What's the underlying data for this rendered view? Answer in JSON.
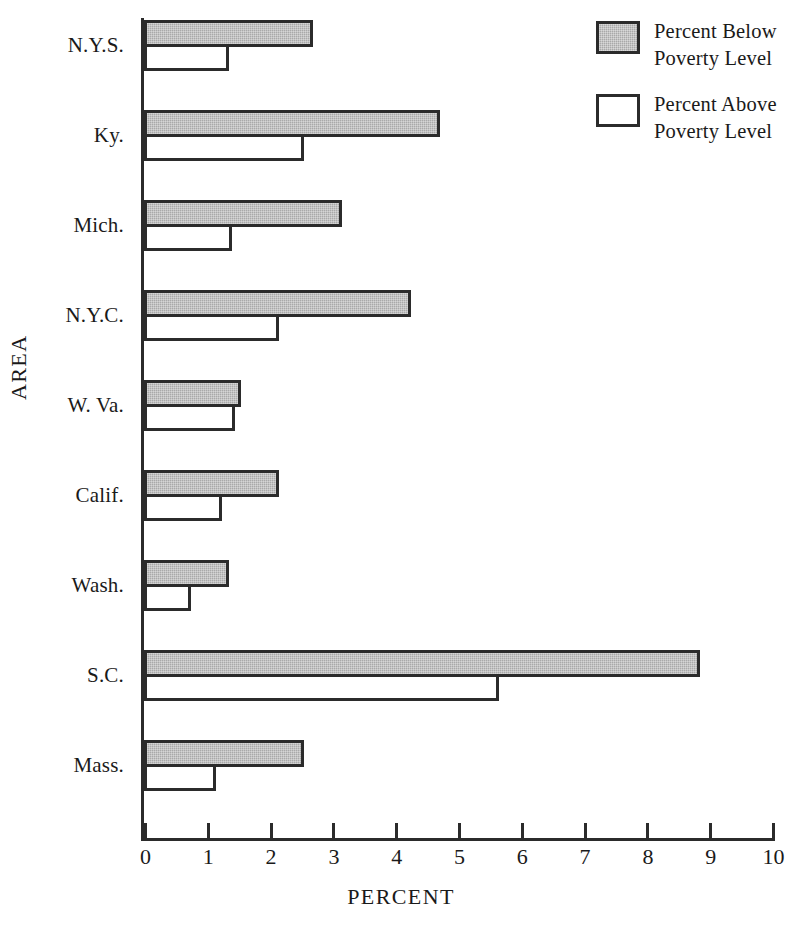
{
  "chart_data": {
    "type": "bar",
    "orientation": "horizontal",
    "title": "",
    "xlabel": "PERCENT",
    "ylabel": "AREA",
    "xlim": [
      0,
      10
    ],
    "xticks": [
      "0",
      "1",
      "2",
      "3",
      "4",
      "5",
      "6",
      "7",
      "8",
      "9",
      "10"
    ],
    "grid": false,
    "legend_position": "top-right",
    "categories": [
      "N.Y.S.",
      "Ky.",
      "Mich.",
      "N.Y.C.",
      "W. Va.",
      "Calif.",
      "Wash.",
      "S.C.",
      "Mass."
    ],
    "series": [
      {
        "name": "Percent Below Poverty Level",
        "color": "#a9a9a9",
        "values": [
          2.65,
          4.67,
          3.1,
          4.2,
          1.5,
          2.1,
          1.3,
          8.8,
          2.5
        ]
      },
      {
        "name": "Percent Above Poverty Level",
        "color": "#ffffff",
        "values": [
          1.3,
          2.5,
          1.35,
          2.1,
          1.4,
          1.2,
          0.7,
          5.6,
          1.1
        ]
      }
    ]
  },
  "legend": {
    "entries": [
      {
        "label": "Percent Below\nPoverty Level",
        "swatch": "below"
      },
      {
        "label": "Percent Above\nPoverty Level",
        "swatch": "above"
      }
    ]
  },
  "axis": {
    "x_title": "PERCENT",
    "y_title": "AREA"
  }
}
